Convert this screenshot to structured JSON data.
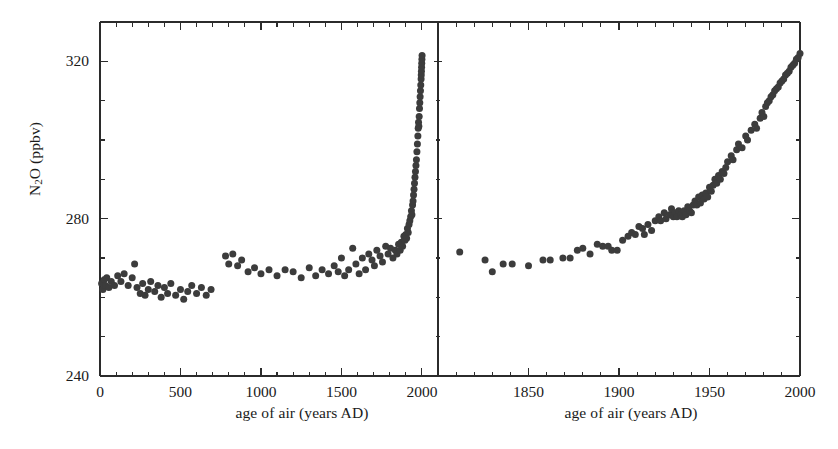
{
  "chart_data": {
    "type": "scatter",
    "title": "",
    "ylabel": "N2O (ppbv)",
    "ylabel_display": "N<sub>2</sub>O (ppbv)",
    "ylim": [
      240,
      330
    ],
    "yticks_major": [
      240,
      280,
      320
    ],
    "yticks_minor": [
      250,
      260,
      270,
      290,
      300,
      310,
      330
    ],
    "grid": false,
    "legend": null,
    "marker": "filled-circle",
    "marker_color": "#3c3c3c",
    "marker_size_px": 7,
    "axis_color": "#2b2b2b",
    "background": "#ffffff",
    "panels": [
      {
        "name": "left-panel",
        "xlabel": "age of air (years AD)",
        "xlim": [
          0,
          2100
        ],
        "xticks_major": [
          0,
          500,
          1000,
          1500,
          2000
        ],
        "xticks_minor": [
          100,
          200,
          300,
          400,
          600,
          700,
          800,
          900,
          1100,
          1200,
          1300,
          1400,
          1600,
          1700,
          1800,
          1900,
          2100
        ],
        "points": [
          [
            10,
            263.5
          ],
          [
            18,
            262.0
          ],
          [
            26,
            264.5
          ],
          [
            34,
            263.0
          ],
          [
            42,
            265.0
          ],
          [
            55,
            262.5
          ],
          [
            70,
            264.0
          ],
          [
            90,
            263.0
          ],
          [
            110,
            265.5
          ],
          [
            130,
            264.0
          ],
          [
            150,
            266.0
          ],
          [
            175,
            263.0
          ],
          [
            200,
            265.0
          ],
          [
            215,
            268.5
          ],
          [
            230,
            262.5
          ],
          [
            250,
            261.0
          ],
          [
            265,
            263.5
          ],
          [
            280,
            260.5
          ],
          [
            300,
            262.0
          ],
          [
            315,
            264.0
          ],
          [
            340,
            261.5
          ],
          [
            360,
            263.0
          ],
          [
            380,
            260.0
          ],
          [
            400,
            262.5
          ],
          [
            420,
            261.0
          ],
          [
            440,
            263.5
          ],
          [
            470,
            260.5
          ],
          [
            500,
            262.0
          ],
          [
            520,
            259.5
          ],
          [
            545,
            261.5
          ],
          [
            570,
            263.0
          ],
          [
            600,
            261.0
          ],
          [
            630,
            262.5
          ],
          [
            660,
            260.5
          ],
          [
            690,
            262.0
          ],
          [
            780,
            270.5
          ],
          [
            800,
            268.5
          ],
          [
            825,
            271.0
          ],
          [
            855,
            268.0
          ],
          [
            880,
            269.5
          ],
          [
            920,
            266.5
          ],
          [
            960,
            267.5
          ],
          [
            1000,
            266.0
          ],
          [
            1050,
            267.0
          ],
          [
            1100,
            265.5
          ],
          [
            1150,
            267.0
          ],
          [
            1200,
            266.5
          ],
          [
            1250,
            265.0
          ],
          [
            1300,
            267.5
          ],
          [
            1340,
            265.5
          ],
          [
            1380,
            267.0
          ],
          [
            1420,
            266.0
          ],
          [
            1455,
            268.0
          ],
          [
            1480,
            266.5
          ],
          [
            1500,
            270.0
          ],
          [
            1520,
            265.5
          ],
          [
            1545,
            267.0
          ],
          [
            1570,
            272.5
          ],
          [
            1590,
            268.5
          ],
          [
            1610,
            266.0
          ],
          [
            1630,
            270.0
          ],
          [
            1650,
            267.0
          ],
          [
            1670,
            271.0
          ],
          [
            1690,
            269.5
          ],
          [
            1705,
            268.0
          ],
          [
            1720,
            272.0
          ],
          [
            1740,
            270.5
          ],
          [
            1755,
            269.0
          ],
          [
            1775,
            273.0
          ],
          [
            1790,
            271.0
          ],
          [
            1805,
            272.5
          ],
          [
            1820,
            270.0
          ],
          [
            1835,
            272.0
          ],
          [
            1845,
            271.0
          ],
          [
            1855,
            273.5
          ],
          [
            1865,
            272.0
          ],
          [
            1872,
            274.0
          ],
          [
            1880,
            273.0
          ],
          [
            1888,
            275.5
          ],
          [
            1895,
            274.5
          ],
          [
            1900,
            276.0
          ],
          [
            1905,
            275.0
          ],
          [
            1910,
            277.5
          ],
          [
            1915,
            276.5
          ],
          [
            1920,
            278.5
          ],
          [
            1925,
            279.5
          ],
          [
            1930,
            280.5
          ],
          [
            1935,
            282.0
          ],
          [
            1938,
            281.0
          ],
          [
            1942,
            283.5
          ],
          [
            1945,
            284.5
          ],
          [
            1948,
            286.0
          ],
          [
            1951,
            287.5
          ],
          [
            1954,
            289.0
          ],
          [
            1957,
            290.5
          ],
          [
            1960,
            292.0
          ],
          [
            1963,
            293.5
          ],
          [
            1966,
            295.0
          ],
          [
            1969,
            297.0
          ],
          [
            1972,
            299.0
          ],
          [
            1975,
            301.0
          ],
          [
            1977,
            303.0
          ],
          [
            1979,
            304.5
          ],
          [
            1981,
            303.5
          ],
          [
            1983,
            306.0
          ],
          [
            1985,
            308.0
          ],
          [
            1987,
            309.5
          ],
          [
            1989,
            311.0
          ],
          [
            1991,
            312.5
          ],
          [
            1993,
            314.0
          ],
          [
            1995,
            315.5
          ],
          [
            1996,
            316.5
          ],
          [
            1997,
            317.5
          ],
          [
            1998,
            318.5
          ],
          [
            1999,
            319.5
          ],
          [
            2000,
            320.5
          ],
          [
            2001,
            321.5
          ]
        ]
      },
      {
        "name": "right-panel",
        "xlabel": "age of air (years AD)",
        "xlim": [
          1800,
          2000
        ],
        "xticks_major": [
          1800,
          1850,
          1900,
          1950,
          2000
        ],
        "xticks_minor": [
          1810,
          1820,
          1830,
          1840,
          1860,
          1870,
          1880,
          1890,
          1910,
          1920,
          1930,
          1940,
          1960,
          1970,
          1980,
          1990
        ],
        "points": [
          [
            1812,
            271.5
          ],
          [
            1826,
            269.5
          ],
          [
            1830,
            266.5
          ],
          [
            1836,
            268.5
          ],
          [
            1841,
            268.5
          ],
          [
            1850,
            268.0
          ],
          [
            1858,
            269.5
          ],
          [
            1862,
            269.5
          ],
          [
            1869,
            270.0
          ],
          [
            1873,
            270.0
          ],
          [
            1877,
            272.0
          ],
          [
            1880,
            272.5
          ],
          [
            1884,
            271.0
          ],
          [
            1888,
            273.5
          ],
          [
            1891,
            273.0
          ],
          [
            1894,
            273.0
          ],
          [
            1896,
            272.0
          ],
          [
            1899,
            272.0
          ],
          [
            1902,
            274.5
          ],
          [
            1905,
            275.5
          ],
          [
            1907,
            276.5
          ],
          [
            1909,
            276.0
          ],
          [
            1911,
            278.0
          ],
          [
            1913,
            277.5
          ],
          [
            1914,
            276.0
          ],
          [
            1916,
            278.5
          ],
          [
            1918,
            277.0
          ],
          [
            1920,
            279.5
          ],
          [
            1922,
            280.5
          ],
          [
            1923,
            279.5
          ],
          [
            1925,
            281.5
          ],
          [
            1926,
            280.0
          ],
          [
            1928,
            281.0
          ],
          [
            1929,
            282.5
          ],
          [
            1930,
            280.5
          ],
          [
            1931,
            281.5
          ],
          [
            1932,
            280.5
          ],
          [
            1933,
            282.0
          ],
          [
            1934,
            281.0
          ],
          [
            1935,
            280.5
          ],
          [
            1936,
            282.0
          ],
          [
            1937,
            281.0
          ],
          [
            1938,
            283.0
          ],
          [
            1939,
            282.0
          ],
          [
            1940,
            281.5
          ],
          [
            1941,
            283.5
          ],
          [
            1942,
            284.5
          ],
          [
            1943,
            283.5
          ],
          [
            1944,
            285.5
          ],
          [
            1945,
            284.0
          ],
          [
            1946,
            286.0
          ],
          [
            1947,
            285.0
          ],
          [
            1948,
            286.5
          ],
          [
            1949,
            285.5
          ],
          [
            1950,
            288.0
          ],
          [
            1951,
            287.0
          ],
          [
            1952,
            288.5
          ],
          [
            1953,
            290.0
          ],
          [
            1954,
            289.0
          ],
          [
            1955,
            291.0
          ],
          [
            1956,
            290.0
          ],
          [
            1957,
            292.0
          ],
          [
            1958,
            291.5
          ],
          [
            1959,
            293.0
          ],
          [
            1960,
            294.5
          ],
          [
            1962,
            296.0
          ],
          [
            1963,
            295.0
          ],
          [
            1965,
            297.5
          ],
          [
            1966,
            299.0
          ],
          [
            1968,
            298.0
          ],
          [
            1970,
            301.0
          ],
          [
            1971,
            300.0
          ],
          [
            1973,
            302.5
          ],
          [
            1975,
            304.0
          ],
          [
            1976,
            303.0
          ],
          [
            1978,
            305.5
          ],
          [
            1979,
            307.0
          ],
          [
            1980,
            306.0
          ],
          [
            1981,
            308.5
          ],
          [
            1982,
            309.5
          ],
          [
            1983,
            310.0
          ],
          [
            1984,
            311.0
          ],
          [
            1985,
            311.5
          ],
          [
            1986,
            312.5
          ],
          [
            1987,
            313.0
          ],
          [
            1988,
            313.5
          ],
          [
            1989,
            314.5
          ],
          [
            1990,
            315.0
          ],
          [
            1991,
            315.5
          ],
          [
            1992,
            316.5
          ],
          [
            1993,
            317.0
          ],
          [
            1994,
            317.5
          ],
          [
            1995,
            318.5
          ],
          [
            1996,
            319.0
          ],
          [
            1997,
            319.5
          ],
          [
            1998,
            320.5
          ],
          [
            1999,
            321.0
          ],
          [
            2000,
            322.0
          ]
        ]
      }
    ]
  }
}
